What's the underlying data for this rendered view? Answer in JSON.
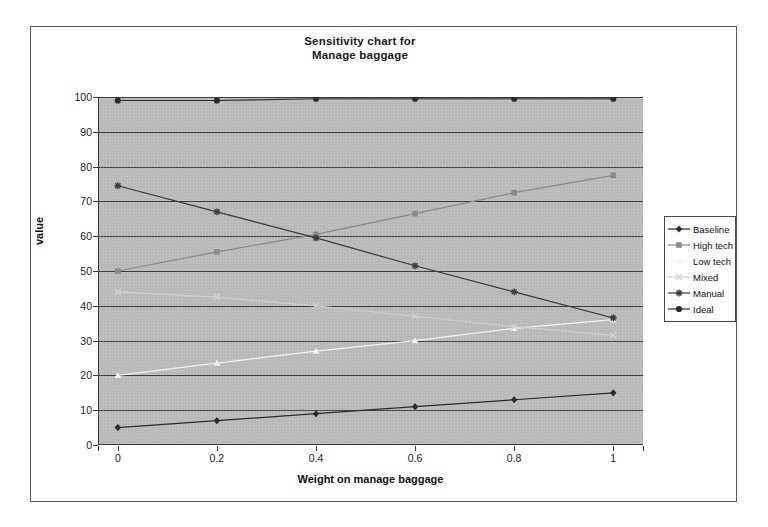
{
  "chart_data": {
    "type": "line",
    "title": "Sensitivity chart for Manage baggage",
    "title_lines": [
      "Sensitivity chart for",
      "Manage baggage"
    ],
    "xlabel": "Weight on manage baggage",
    "ylabel": "value",
    "x": [
      0,
      0.2,
      0.4,
      0.6,
      0.8,
      1
    ],
    "xtick_labels": [
      "0",
      "0.2",
      "0.4",
      "0.6",
      "0.8",
      "1"
    ],
    "xlim": [
      -0.04,
      1.06
    ],
    "ylim": [
      0,
      100
    ],
    "ytick_labels": [
      "0",
      "10",
      "20",
      "30",
      "40",
      "50",
      "60",
      "70",
      "80",
      "90",
      "100"
    ],
    "yticks": [
      0,
      10,
      20,
      30,
      40,
      50,
      60,
      70,
      80,
      90,
      100
    ],
    "grid": "horizontal",
    "legend_position": "right",
    "plot_background": "#b9b9b9",
    "series": [
      {
        "name": "Baseline",
        "marker": "diamond",
        "color": "#2b2b2b",
        "values": [
          5,
          7,
          9,
          11,
          13,
          15
        ]
      },
      {
        "name": "High tech",
        "marker": "square",
        "color": "#8a8a8a",
        "values": [
          50,
          55.5,
          60.5,
          66.5,
          72.5,
          77.5
        ]
      },
      {
        "name": "Low tech",
        "marker": "triangle",
        "color": "#f2f2f2",
        "values": [
          20,
          23.5,
          27,
          30,
          33.5,
          36
        ]
      },
      {
        "name": "Mixed",
        "marker": "cross",
        "color": "#d0d0d0",
        "values": [
          44,
          42.5,
          40,
          37,
          34,
          31.5
        ]
      },
      {
        "name": "Manual",
        "marker": "star",
        "color": "#3a3a3a",
        "values": [
          74.5,
          67,
          59.5,
          51.5,
          44,
          36.5
        ]
      },
      {
        "name": "Ideal",
        "marker": "circle",
        "color": "#2b2b2b",
        "values": [
          99,
          99,
          99.5,
          99.5,
          99.5,
          99.5
        ]
      }
    ]
  }
}
